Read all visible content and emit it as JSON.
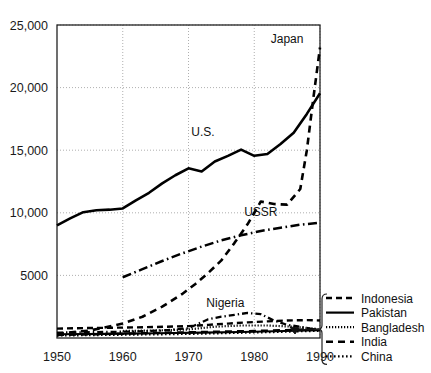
{
  "chart_data": {
    "type": "line",
    "title": "",
    "xlabel": "",
    "ylabel": "",
    "xlim": [
      1950,
      1990
    ],
    "ylim": [
      0,
      25000
    ],
    "grid": true,
    "legend_position": "bottom-right",
    "xticks": [
      "1950",
      "1960",
      "1970",
      "1980",
      "1990"
    ],
    "xtick_values": [
      1950,
      1960,
      1970,
      1980,
      1990
    ],
    "yticks": [
      "5000",
      "10,000",
      "15,000",
      "20,000",
      "25,000"
    ],
    "ytick_values": [
      5000,
      10000,
      15000,
      20000,
      25000
    ],
    "annotations": [
      {
        "text": "Japan",
        "x": 1985.0,
        "y": 23600
      },
      {
        "text": "U.S.",
        "x": 1972.2,
        "y": 16100
      },
      {
        "text": "USSR",
        "x": 1981.0,
        "y": 9750
      },
      {
        "text": "Nigeria",
        "x": 1975.6,
        "y": 2450
      }
    ],
    "series": [
      {
        "name": "U.S.",
        "style": "solid",
        "x": [
          1950,
          1952,
          1954,
          1956,
          1958,
          1960,
          1962,
          1964,
          1966,
          1968,
          1970,
          1972,
          1974,
          1976,
          1978,
          1980,
          1982,
          1984,
          1986,
          1988,
          1990
        ],
        "values": [
          9000,
          9550,
          10050,
          10200,
          10250,
          10350,
          11000,
          11600,
          12350,
          13000,
          13550,
          13300,
          14100,
          14550,
          15050,
          14550,
          14700,
          15500,
          16400,
          17900,
          19550
        ]
      },
      {
        "name": "Japan",
        "style": "dashed-long",
        "x": [
          1950,
          1955,
          1960,
          1963,
          1966,
          1969,
          1971,
          1973,
          1975,
          1977,
          1979,
          1981,
          1983,
          1985,
          1987,
          1988,
          1989,
          1990
        ],
        "values": [
          350,
          600,
          1150,
          1700,
          2500,
          3500,
          4300,
          5200,
          6200,
          7600,
          9100,
          10900,
          10700,
          10650,
          11900,
          15000,
          19200,
          23200
        ]
      },
      {
        "name": "USSR",
        "style": "dash-dot",
        "x": [
          1960,
          1963,
          1966,
          1969,
          1972,
          1975,
          1978,
          1981,
          1984,
          1987,
          1990
        ],
        "values": [
          4850,
          5500,
          6150,
          6750,
          7300,
          7800,
          8200,
          8550,
          8800,
          9050,
          9200
        ]
      },
      {
        "name": "Nigeria",
        "style": "dash-dot-small",
        "x": [
          1950,
          1956,
          1962,
          1966,
          1970,
          1973,
          1975,
          1977,
          1979,
          1981,
          1983,
          1985,
          1987,
          1989,
          1990
        ],
        "values": [
          430,
          470,
          520,
          600,
          780,
          1500,
          1700,
          1850,
          2000,
          1900,
          1400,
          1050,
          900,
          700,
          600
        ]
      },
      {
        "name": "Indonesia",
        "style": "dashed",
        "x": [
          1950,
          1955,
          1960,
          1965,
          1970,
          1973,
          1976,
          1979,
          1982,
          1985,
          1988,
          1990
        ],
        "values": [
          750,
          800,
          830,
          880,
          950,
          1050,
          1150,
          1250,
          1330,
          1400,
          1430,
          1400
        ]
      },
      {
        "name": "Pakistan",
        "style": "solid-thin",
        "x": [
          1950,
          1958,
          1965,
          1972,
          1978,
          1983,
          1988,
          1990
        ],
        "values": [
          300,
          330,
          380,
          430,
          480,
          540,
          600,
          620
        ]
      },
      {
        "name": "Bangladesh",
        "style": "dotted-fine",
        "x": [
          1960,
          1965,
          1970,
          1974,
          1978,
          1982,
          1986,
          1990
        ],
        "values": [
          560,
          600,
          680,
          900,
          1000,
          1000,
          900,
          700
        ]
      },
      {
        "name": "India",
        "style": "dashed-medium",
        "x": [
          1950,
          1956,
          1962,
          1968,
          1974,
          1980,
          1984,
          1987,
          1990
        ],
        "values": [
          240,
          300,
          370,
          440,
          500,
          560,
          620,
          670,
          700
        ]
      },
      {
        "name": "China",
        "style": "dotted",
        "x": [
          1950,
          1958,
          1966,
          1972,
          1978,
          1983,
          1987,
          1990
        ],
        "values": [
          200,
          250,
          300,
          350,
          420,
          480,
          540,
          580
        ]
      }
    ]
  },
  "legend": {
    "items": [
      {
        "label": "Indonesia",
        "style": "dashed"
      },
      {
        "label": "Pakistan",
        "style": "solid-thin"
      },
      {
        "label": "Bangladesh",
        "style": "dotted-fine"
      },
      {
        "label": "India",
        "style": "dashed-medium"
      },
      {
        "label": "China",
        "style": "dotted"
      }
    ]
  }
}
